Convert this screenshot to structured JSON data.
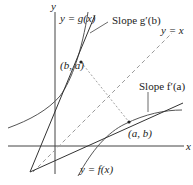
{
  "diagram": {
    "axes": {
      "x_label": "x",
      "y_label": "y"
    },
    "curves": {
      "g_label": "y = g(x)",
      "f_label": "y = f(x)",
      "diagonal_label": "y = x"
    },
    "points": {
      "ba_label": "(b, a)",
      "ab_label": "(a, b)"
    },
    "annotations": {
      "slope_g": "Slope g′(b)",
      "slope_f": "Slope f′(a)"
    },
    "colors": {
      "curve": "#3a3a3a",
      "axis": "#3a3a3a",
      "diagonal": "#9a9a9a",
      "perpendicular": "#7a7a7a"
    }
  }
}
